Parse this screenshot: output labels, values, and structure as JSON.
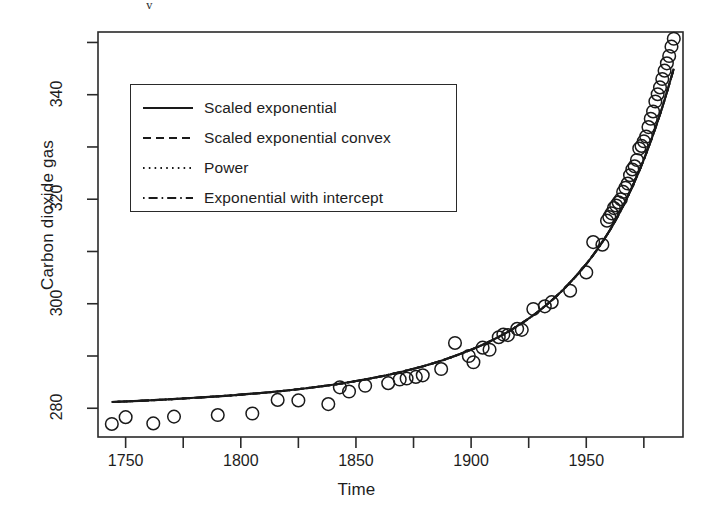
{
  "figure": {
    "background": "#ffffff",
    "foreground": "#1a1a1a",
    "crop_artifact": "y"
  },
  "chart_data": {
    "type": "scatter",
    "title": "",
    "subtitle": "",
    "xlabel": "Time",
    "ylabel": "Carbon dioxide gas",
    "xlim": [
      1738,
      1992
    ],
    "ylim": [
      274.5,
      352
    ],
    "grid": false,
    "xticks": [
      1750,
      1800,
      1850,
      1900,
      1950
    ],
    "xtick_labels": [
      "1750",
      "1800",
      "1850",
      "1900",
      "1950"
    ],
    "x_minor_ticks": [
      1775,
      1825,
      1875,
      1925,
      1975
    ],
    "yticks": [
      280,
      300,
      320,
      340
    ],
    "ytick_labels": [
      "280",
      "300",
      "320",
      "340"
    ],
    "y_minor_ticks": [
      290,
      310,
      330,
      350
    ],
    "marker": "open-circle",
    "marker_size": 8,
    "legend_position": "top-left-inside",
    "points": [
      {
        "x": 1744,
        "y": 277.0
      },
      {
        "x": 1750,
        "y": 278.3
      },
      {
        "x": 1762,
        "y": 277.1
      },
      {
        "x": 1771,
        "y": 278.4
      },
      {
        "x": 1790,
        "y": 278.7
      },
      {
        "x": 1805,
        "y": 279.0
      },
      {
        "x": 1816,
        "y": 281.6
      },
      {
        "x": 1825,
        "y": 281.5
      },
      {
        "x": 1838,
        "y": 280.8
      },
      {
        "x": 1843,
        "y": 284.0
      },
      {
        "x": 1847,
        "y": 283.2
      },
      {
        "x": 1854,
        "y": 284.3
      },
      {
        "x": 1864,
        "y": 284.8
      },
      {
        "x": 1869,
        "y": 285.5
      },
      {
        "x": 1872,
        "y": 285.7
      },
      {
        "x": 1876,
        "y": 286.0
      },
      {
        "x": 1879,
        "y": 286.3
      },
      {
        "x": 1887,
        "y": 287.5
      },
      {
        "x": 1893,
        "y": 292.5
      },
      {
        "x": 1899,
        "y": 290.0
      },
      {
        "x": 1901,
        "y": 288.8
      },
      {
        "x": 1905,
        "y": 291.6
      },
      {
        "x": 1908,
        "y": 291.2
      },
      {
        "x": 1912,
        "y": 293.6
      },
      {
        "x": 1914,
        "y": 294.1
      },
      {
        "x": 1916,
        "y": 294.0
      },
      {
        "x": 1920,
        "y": 295.2
      },
      {
        "x": 1922,
        "y": 295.0
      },
      {
        "x": 1927,
        "y": 299.0
      },
      {
        "x": 1932,
        "y": 299.5
      },
      {
        "x": 1935,
        "y": 300.3
      },
      {
        "x": 1943,
        "y": 302.5
      },
      {
        "x": 1950,
        "y": 306.0
      },
      {
        "x": 1953,
        "y": 311.8
      },
      {
        "x": 1957,
        "y": 311.3
      },
      {
        "x": 1959,
        "y": 315.9
      },
      {
        "x": 1960,
        "y": 316.6
      },
      {
        "x": 1961,
        "y": 317.3
      },
      {
        "x": 1962,
        "y": 318.3
      },
      {
        "x": 1963,
        "y": 318.8
      },
      {
        "x": 1964,
        "y": 319.4
      },
      {
        "x": 1965,
        "y": 320.0
      },
      {
        "x": 1966,
        "y": 321.4
      },
      {
        "x": 1967,
        "y": 322.2
      },
      {
        "x": 1968,
        "y": 323.0
      },
      {
        "x": 1969,
        "y": 324.6
      },
      {
        "x": 1970,
        "y": 325.7
      },
      {
        "x": 1971,
        "y": 326.3
      },
      {
        "x": 1972,
        "y": 327.5
      },
      {
        "x": 1973,
        "y": 329.7
      },
      {
        "x": 1974,
        "y": 330.2
      },
      {
        "x": 1975,
        "y": 331.1
      },
      {
        "x": 1976,
        "y": 332.0
      },
      {
        "x": 1977,
        "y": 333.8
      },
      {
        "x": 1978,
        "y": 335.4
      },
      {
        "x": 1979,
        "y": 336.8
      },
      {
        "x": 1980,
        "y": 338.7
      },
      {
        "x": 1981,
        "y": 340.1
      },
      {
        "x": 1982,
        "y": 341.4
      },
      {
        "x": 1983,
        "y": 343.0
      },
      {
        "x": 1984,
        "y": 344.6
      },
      {
        "x": 1985,
        "y": 346.0
      },
      {
        "x": 1986,
        "y": 347.4
      },
      {
        "x": 1987,
        "y": 349.2
      },
      {
        "x": 1988,
        "y": 350.7
      }
    ],
    "series": [
      {
        "name": "Scaled exponential",
        "style": "solid",
        "model": "scaled-exponential",
        "fit": [
          {
            "x": 1744,
            "y": 281.2
          },
          {
            "x": 1760,
            "y": 281.5
          },
          {
            "x": 1780,
            "y": 282.0
          },
          {
            "x": 1800,
            "y": 282.6
          },
          {
            "x": 1820,
            "y": 283.4
          },
          {
            "x": 1840,
            "y": 284.5
          },
          {
            "x": 1855,
            "y": 285.6
          },
          {
            "x": 1870,
            "y": 287.0
          },
          {
            "x": 1885,
            "y": 288.8
          },
          {
            "x": 1900,
            "y": 291.2
          },
          {
            "x": 1910,
            "y": 293.2
          },
          {
            "x": 1920,
            "y": 295.7
          },
          {
            "x": 1930,
            "y": 298.8
          },
          {
            "x": 1940,
            "y": 302.7
          },
          {
            "x": 1950,
            "y": 307.6
          },
          {
            "x": 1958,
            "y": 312.5
          },
          {
            "x": 1964,
            "y": 317.0
          },
          {
            "x": 1970,
            "y": 322.4
          },
          {
            "x": 1975,
            "y": 327.6
          },
          {
            "x": 1980,
            "y": 333.6
          },
          {
            "x": 1984,
            "y": 339.0
          },
          {
            "x": 1988,
            "y": 345.0
          }
        ]
      },
      {
        "name": "Scaled exponential convex",
        "style": "dashed",
        "model": "scaled-exponential-convex"
      },
      {
        "name": "Power",
        "style": "dotted",
        "model": "power"
      },
      {
        "name": "Exponential with intercept",
        "style": "dashdot",
        "model": "exponential-with-intercept"
      }
    ]
  },
  "legend": {
    "items": [
      {
        "label": "Scaled exponential",
        "style": "solid"
      },
      {
        "label": "Scaled exponential convex",
        "style": "dashed"
      },
      {
        "label": "Power",
        "style": "dotted"
      },
      {
        "label": "Exponential with intercept",
        "style": "dashdot"
      }
    ]
  }
}
